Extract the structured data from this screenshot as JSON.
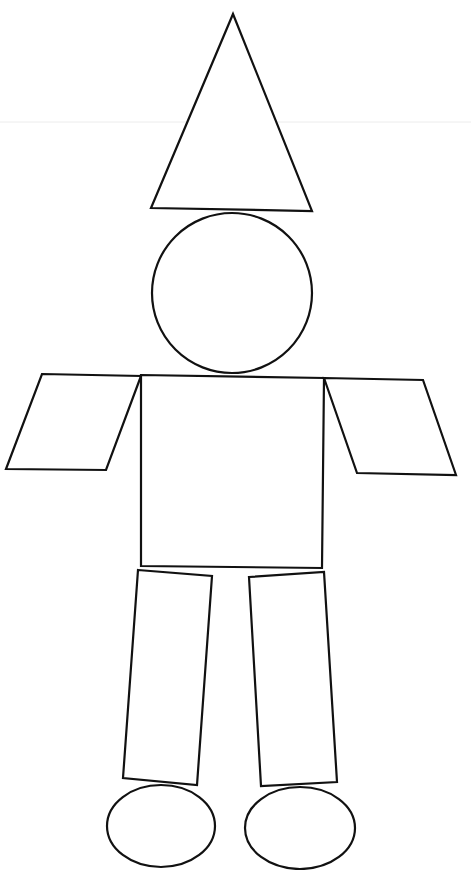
{
  "figure": {
    "title": "",
    "background": "#ffffff",
    "stroke_color": "#111111",
    "width": 471,
    "height": 870
  },
  "shapes": {
    "hat": {
      "type": "triangle",
      "points": "233,14 312,211 151,208"
    },
    "head": {
      "type": "circle",
      "cx": 232,
      "cy": 293,
      "r": 80
    },
    "body": {
      "type": "rectangle",
      "points": "141,375 324,378 322,568 141,566"
    },
    "left_arm": {
      "type": "parallelogram",
      "points": "42,374 141,376 106,470 6,469"
    },
    "right_arm": {
      "type": "parallelogram",
      "points": "324,378 423,380 456,475 357,473"
    },
    "left_leg": {
      "type": "quadrilateral",
      "points": "138,570 212,576 197,785 123,778"
    },
    "right_leg": {
      "type": "quadrilateral",
      "points": "249,577 324,572 337,782 261,786"
    },
    "left_foot": {
      "type": "ellipse",
      "cx": 161,
      "cy": 826,
      "rx": 54,
      "ry": 41
    },
    "right_foot": {
      "type": "ellipse",
      "cx": 300,
      "cy": 828,
      "rx": 55,
      "ry": 41
    }
  }
}
